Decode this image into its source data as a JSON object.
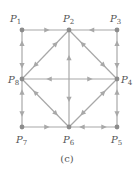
{
  "caption": "(c)",
  "colors": {
    "edge": "#a8a8a8",
    "node": "#8c8c8c",
    "label": "#555555"
  },
  "nodes": [
    {
      "id": "P1",
      "label": "P",
      "sub": "1",
      "x": 22,
      "y": 30,
      "lx": 10,
      "ly": 22
    },
    {
      "id": "P2",
      "label": "P",
      "sub": "2",
      "x": 69,
      "y": 30,
      "lx": 63,
      "ly": 22
    },
    {
      "id": "P3",
      "label": "P",
      "sub": "3",
      "x": 117,
      "y": 30,
      "lx": 110,
      "ly": 22
    },
    {
      "id": "P4",
      "label": "P",
      "sub": "4",
      "x": 117,
      "y": 79,
      "lx": 121,
      "ly": 83
    },
    {
      "id": "P5",
      "label": "P",
      "sub": "5",
      "x": 117,
      "y": 127,
      "lx": 111,
      "ly": 143
    },
    {
      "id": "P6",
      "label": "P",
      "sub": "6",
      "x": 69,
      "y": 127,
      "lx": 63,
      "ly": 143
    },
    {
      "id": "P7",
      "label": "P",
      "sub": "7",
      "x": 22,
      "y": 127,
      "lx": 16,
      "ly": 143
    },
    {
      "id": "P8",
      "label": "P",
      "sub": "8",
      "x": 22,
      "y": 79,
      "lx": 8,
      "ly": 83
    }
  ],
  "edges": [
    {
      "from": "P1",
      "to": "P2",
      "dir": "forward"
    },
    {
      "from": "P3",
      "to": "P2",
      "dir": "forward"
    },
    {
      "from": "P1",
      "to": "P8",
      "dir": "both"
    },
    {
      "from": "P3",
      "to": "P4",
      "dir": "both"
    },
    {
      "from": "P8",
      "to": "P7",
      "dir": "both"
    },
    {
      "from": "P4",
      "to": "P5",
      "dir": "both"
    },
    {
      "from": "P7",
      "to": "P6",
      "dir": "forward"
    },
    {
      "from": "P6",
      "to": "P5",
      "dir": "both"
    },
    {
      "from": "P2",
      "to": "P8",
      "dir": "both"
    },
    {
      "from": "P2",
      "to": "P4",
      "dir": "both"
    },
    {
      "from": "P8",
      "to": "P6",
      "dir": "both"
    },
    {
      "from": "P6",
      "to": "P4",
      "dir": "both"
    },
    {
      "from": "P8",
      "to": "P4",
      "dir": "both"
    },
    {
      "from": "P2",
      "to": "P6",
      "dir": "both"
    }
  ]
}
